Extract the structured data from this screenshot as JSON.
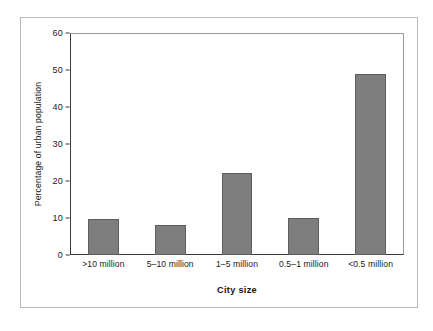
{
  "chart_data": {
    "type": "bar",
    "title": "",
    "subtitle": "",
    "xlabel": "City size",
    "ylabel": "Percentage of urban population",
    "categories": [
      ">10 million",
      "5–10 million",
      "1–5 million",
      "0.5–1 million",
      "<0.5 million"
    ],
    "values": [
      9.8,
      8.0,
      22.2,
      10.0,
      49.0
    ],
    "series": [
      {
        "name": "Percentage of urban population",
        "values": [
          9.8,
          8.0,
          22.2,
          10.0,
          49.0
        ]
      }
    ],
    "ylim": [
      0,
      60
    ],
    "xlim": null,
    "ytick_labels": [
      "0",
      "10",
      "20",
      "30",
      "40",
      "50",
      "60"
    ],
    "ytick_values": [
      0,
      10,
      20,
      30,
      40,
      50,
      60
    ],
    "ytick_interval": 10,
    "grid": false,
    "legend": false,
    "legend_position": "none",
    "annotations": [],
    "bar_fill_color": "#7e7e7e",
    "bar_edge_color": "#5e5e5e",
    "axis_color": "#3b3b3b",
    "frame_color": "#b9b9b9",
    "plot_frame_color": "#9a9a9a",
    "background_color": "#ffffff",
    "text_color": "#1a1a1a"
  }
}
